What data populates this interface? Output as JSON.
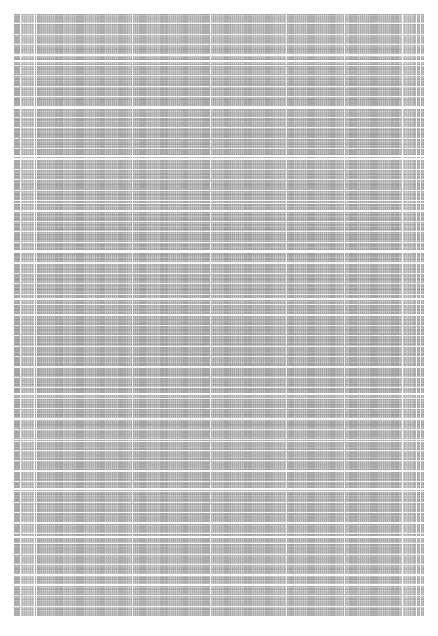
{
  "document": {
    "title": "Document page",
    "page_surface_color": "#ffffff",
    "content": {
      "name": "scanned-table-page",
      "description": "Dense tabular document rendered at very small zoom; individual characters are not resolvable and appear as a woven gray texture.",
      "base_color": "#a9a9a9",
      "rule_color": "#ffffff",
      "ink_color": "#5a5a5a",
      "bounds": {
        "left": 14,
        "top": 14,
        "width": 410,
        "height": 602
      },
      "row_rule_spacing_px": 10.4,
      "group_rule_spacing_px": 47.6,
      "text_line_spacing_px": 3.4,
      "column_rules_x": [
        6,
        20,
        21.5,
        118,
        196,
        272,
        330,
        388,
        402,
        406
      ],
      "gutter": {
        "left_x": 6,
        "left_width": 14,
        "right_x": 388,
        "right_width": 14
      }
    },
    "caption": {
      "text": "",
      "color": "#c4c4c4"
    }
  }
}
